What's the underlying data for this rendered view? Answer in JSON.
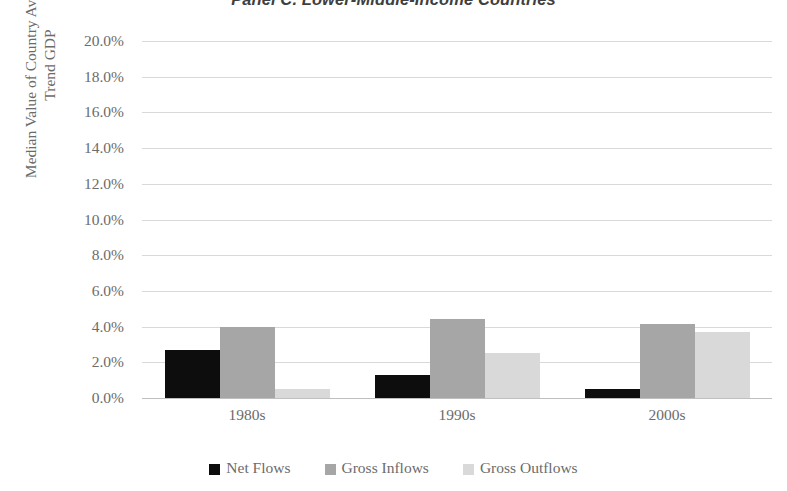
{
  "chart_data": {
    "type": "bar",
    "title": "Panel C. Lower-Middle-Income Countries",
    "xlabel": "",
    "ylabel_line1": "Median Value of Country Averages /",
    "ylabel_line2": "Trend GDP",
    "categories": [
      "1980s",
      "1990s",
      "2000s"
    ],
    "series": [
      {
        "name": "Net Flows",
        "color": "#0d0d0d",
        "values": [
          2.7,
          1.3,
          0.5
        ]
      },
      {
        "name": "Gross Inflows",
        "color": "#a6a6a6",
        "values": [
          4.0,
          4.4,
          4.15
        ]
      },
      {
        "name": "Gross Outflows",
        "color": "#d9d9d9",
        "values": [
          0.5,
          2.5,
          3.7
        ]
      }
    ],
    "ylim": [
      0,
      20
    ],
    "ytick_step": 2,
    "ytick_labels": [
      "20.0%",
      "18.0%",
      "16.0%",
      "14.0%",
      "12.0%",
      "10.0%",
      "8.0%",
      "6.0%",
      "4.0%",
      "2.0%",
      "0.0%"
    ],
    "ytick_values": [
      20,
      18,
      16,
      14,
      12,
      10,
      8,
      6,
      4,
      2,
      0
    ],
    "grid": true,
    "legend_position": "bottom",
    "value_unit": "percent"
  }
}
